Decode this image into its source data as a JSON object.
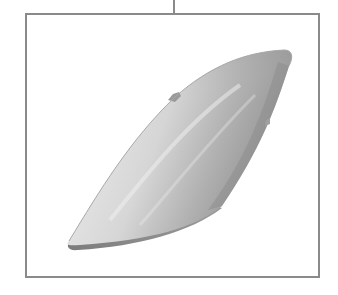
{
  "figure": {
    "type": "line-drawing",
    "style": "grayscale shaded rendering",
    "colors": {
      "frame_stroke": "#8a8a8a",
      "background": "#ffffff",
      "shape_light": "#e2e2e2",
      "shape_mid": "#bdbdbd",
      "shape_dark": "#8c8c8c",
      "rim": "#7a7a7a"
    },
    "elements": {
      "leader_line": "vertical connector at top center",
      "frame": "rectangular border around component",
      "component": "elongated curved cover tapering from bottom-left to top-right",
      "tabs": "small mounting tabs on upper edge and right edge"
    }
  }
}
